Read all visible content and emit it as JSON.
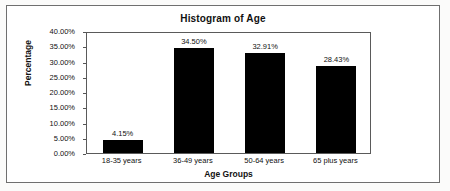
{
  "figure": {
    "title": "Histogram of Age"
  },
  "chart_data": {
    "type": "bar",
    "title": "Histogram of Age",
    "xlabel": "Age Groups",
    "ylabel": "Percentage",
    "categories": [
      "18-35 years",
      "36-49 years",
      "50-64 years",
      "65 plus years"
    ],
    "values": [
      4.15,
      34.5,
      32.91,
      28.43
    ],
    "value_labels": [
      "4.15%",
      "34.50%",
      "32.91%",
      "28.43%"
    ],
    "ylim": [
      0,
      40
    ],
    "ytick_values": [
      0,
      5,
      10,
      15,
      20,
      25,
      30,
      35,
      40
    ],
    "ytick_labels": [
      "0.00%",
      "5.00%",
      "10.00%",
      "15.00%",
      "20.00%",
      "25.00%",
      "30.00%",
      "35.00%",
      "40.00%"
    ],
    "grid": false,
    "legend": "none",
    "bar_color": "#000000",
    "plot_background": "#ffffff",
    "units": "percent"
  }
}
